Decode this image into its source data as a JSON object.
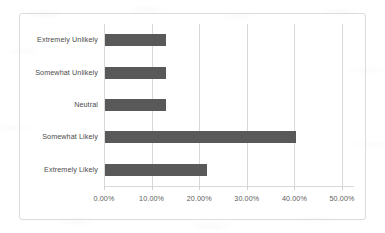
{
  "chart_data": {
    "type": "bar",
    "orientation": "horizontal",
    "title": "",
    "subtitle": "",
    "xlabel": "",
    "ylabel": "",
    "categories": [
      "Extremely Unlikely",
      "Somewhat Unlikely",
      "Neutral",
      "Somewhat Likely",
      "Extremely Likely"
    ],
    "values": [
      12.8,
      12.8,
      12.8,
      40.2,
      21.4
    ],
    "value_format": "percent",
    "xlim": [
      0,
      52.5
    ],
    "xticks": [
      0,
      10,
      20,
      30,
      40,
      50
    ],
    "xtick_labels": [
      "0.00%",
      "10.00%",
      "20.00%",
      "30.00%",
      "40.00%",
      "50.00%"
    ],
    "grid": "vertical",
    "legend": "none",
    "series": [
      {
        "name": "Response share",
        "color": "#595959",
        "values": [
          12.8,
          12.8,
          12.8,
          40.2,
          21.4
        ]
      }
    ]
  },
  "chart": {
    "bar_color": "#595959",
    "grid_color": "#d9d9d9",
    "border_color": "#dcdcdc",
    "label_color": "#4a4a4a",
    "tick_color": "#5c5c5c"
  }
}
